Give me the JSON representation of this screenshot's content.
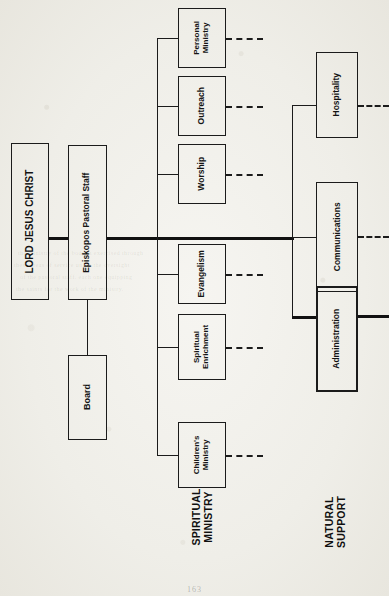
{
  "document": {
    "kind": "organizational-chart",
    "orientation": "rotated-90-ccw",
    "page_number": "163"
  },
  "nodes": {
    "lord": {
      "label": "LORD JESUS CHRIST"
    },
    "episkopos": {
      "label": "Episkopos Pastoral Staff"
    },
    "board": {
      "label": "Board"
    }
  },
  "sections": [
    {
      "caption": "SPIRITUAL\nMINISTRY",
      "caption_lines": [
        "SPIRITUAL",
        "MINISTRY"
      ],
      "items": [
        {
          "label": "Personal\nMinistry",
          "lines": [
            "Personal",
            "Ministry"
          ],
          "stub": "dashed"
        },
        {
          "label": "Outreach",
          "lines": [
            "Outreach"
          ],
          "stub": "dashed"
        },
        {
          "label": "Worship",
          "lines": [
            "Worship"
          ],
          "stub": "dashed"
        },
        {
          "label": "Evangelism",
          "lines": [
            "Evangelism"
          ],
          "stub": "dashed"
        },
        {
          "label": "Spiritual\nEnrichment",
          "lines": [
            "Spiritual",
            "Enrichment"
          ],
          "stub": "dashed"
        },
        {
          "label": "Children's\nMinistry",
          "lines": [
            "Children's",
            "Ministry"
          ],
          "stub": "dashed"
        }
      ]
    },
    {
      "caption": "NATURAL\nSUPPORT",
      "caption_lines": [
        "NATURAL",
        "SUPPORT"
      ],
      "items": [
        {
          "label": "Hospitality",
          "lines": [
            "Hospitality"
          ],
          "stub": "dashed"
        },
        {
          "label": "Communications",
          "lines": [
            "Communications"
          ],
          "stub": "dashed"
        },
        {
          "label": "Administration",
          "lines": [
            "Administration"
          ],
          "stub": "solid"
        }
      ]
    }
  ],
  "labels": {
    "spiritual_l1": "SPIRITUAL",
    "spiritual_l2": "MINISTRY",
    "natural_l1": "NATURAL",
    "natural_l2": "SUPPORT",
    "personal_l1": "Personal",
    "personal_l2": "Ministry",
    "outreach": "Outreach",
    "worship": "Worship",
    "evangelism": "Evangelism",
    "spiritenrich_l1": "Spiritual",
    "spiritenrich_l2": "Enrichment",
    "children_l1": "Children's",
    "children_l2": "Ministry",
    "hospitality": "Hospitality",
    "communications": "Communications",
    "administration": "Administration"
  },
  "bleed_text": {
    "a": "the ministry of the body is exercised through",
    "b": "these areas of service under the oversight",
    "c": "of the pastoral staff, each one equipping",
    "d": "the saints for the work of the ministry."
  },
  "colors": {
    "ink": "#1b1b1b",
    "paper": "#f2f1ec",
    "bleed": "rgba(120,116,105,.16)"
  }
}
